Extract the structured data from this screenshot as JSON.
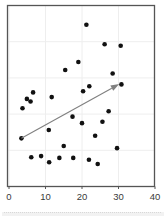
{
  "chart_data": {
    "type": "scatter",
    "title": "",
    "subtitle": "",
    "xlabel": "",
    "ylabel": "",
    "xlim": [
      0,
      40
    ],
    "ylim": [
      0,
      50
    ],
    "xticks": [
      0,
      10,
      20,
      30,
      40
    ],
    "xtick_labels": [
      "0",
      "10",
      "20",
      "30",
      "40"
    ],
    "yticks": [],
    "ytick_labels": [],
    "grid": true,
    "grid_color": "#eeeeee",
    "legend": false,
    "legend_position": "none",
    "frame": true,
    "frame_color": "#555555",
    "point_color": "#111111",
    "point_size": 4.4,
    "series": [
      {
        "name": "observations",
        "marker": "circle",
        "color": "#111111",
        "points": [
          {
            "x": 21.2,
            "y": 44.7
          },
          {
            "x": 26.2,
            "y": 39.3
          },
          {
            "x": 30.6,
            "y": 38.9
          },
          {
            "x": 19.0,
            "y": 34.4
          },
          {
            "x": 15.4,
            "y": 32.2
          },
          {
            "x": 28.4,
            "y": 31.2
          },
          {
            "x": 30.8,
            "y": 28.2
          },
          {
            "x": 22.0,
            "y": 27.7
          },
          {
            "x": 20.3,
            "y": 26.3
          },
          {
            "x": 6.6,
            "y": 26.0
          },
          {
            "x": 11.7,
            "y": 24.7
          },
          {
            "x": 4.9,
            "y": 24.2
          },
          {
            "x": 5.9,
            "y": 23.5
          },
          {
            "x": 3.7,
            "y": 21.6
          },
          {
            "x": 27.3,
            "y": 20.8
          },
          {
            "x": 17.4,
            "y": 19.3
          },
          {
            "x": 25.6,
            "y": 17.9
          },
          {
            "x": 20.0,
            "y": 17.5
          },
          {
            "x": 10.9,
            "y": 15.6
          },
          {
            "x": 23.6,
            "y": 14.0
          },
          {
            "x": 3.4,
            "y": 13.3
          },
          {
            "x": 15.0,
            "y": 11.2
          },
          {
            "x": 29.6,
            "y": 10.6
          },
          {
            "x": 6.1,
            "y": 8.1
          },
          {
            "x": 8.8,
            "y": 8.4
          },
          {
            "x": 13.8,
            "y": 7.9
          },
          {
            "x": 17.6,
            "y": 7.9
          },
          {
            "x": 11.0,
            "y": 6.7
          },
          {
            "x": 21.9,
            "y": 7.4
          },
          {
            "x": 24.3,
            "y": 6.2
          }
        ]
      }
    ],
    "annotations": [
      {
        "type": "arrow",
        "name": "trend-arrow",
        "color": "#808080",
        "x_start": 3.4,
        "y_start": 13.3,
        "x_end": 30.2,
        "y_end": 28.3,
        "head": "filled-triangle"
      }
    ]
  }
}
